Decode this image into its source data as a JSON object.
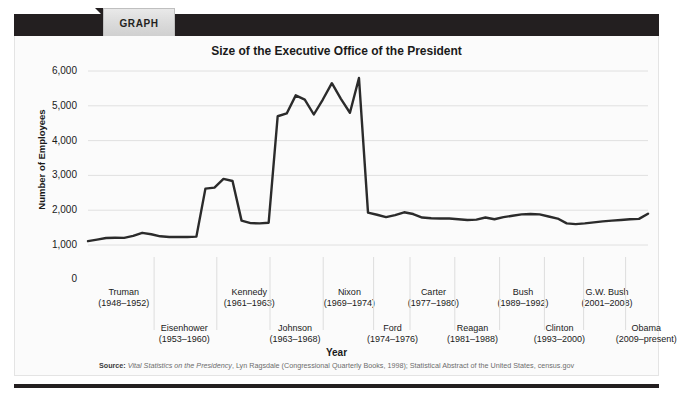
{
  "header": {
    "tab_label": "GRAPH"
  },
  "chart_data": {
    "type": "line",
    "title": "Size of the Executive Office of the President",
    "xlabel": "Year",
    "ylabel": "Number of Employees",
    "ylim": [
      1000,
      6000
    ],
    "axis_break": true,
    "zero_tick": "0",
    "grid": true,
    "legend": "none",
    "line_color": "#2b2b2b",
    "ytick_labels": [
      "6,000",
      "5,000",
      "4,000",
      "3,000",
      "2,000",
      "1,000"
    ],
    "ytick_values": [
      6000,
      5000,
      4000,
      3000,
      2000,
      1000
    ],
    "x": [
      1948,
      1949,
      1950,
      1951,
      1952,
      1953,
      1954,
      1955,
      1956,
      1957,
      1958,
      1959,
      1960,
      1961,
      1962,
      1963,
      1964,
      1965,
      1966,
      1967,
      1968,
      1969,
      1970,
      1971,
      1972,
      1973,
      1974,
      1975,
      1976,
      1977,
      1978,
      1979,
      1980,
      1981,
      1982,
      1983,
      1984,
      1985,
      1986,
      1987,
      1988,
      1989,
      1990,
      1991,
      1992,
      1993,
      1994,
      1995,
      1996,
      1997,
      1998,
      1999,
      2000,
      2001,
      2002,
      2003,
      2004,
      2005,
      2006,
      2007,
      2008,
      2009,
      2010
    ],
    "values": [
      1110,
      1155,
      1200,
      1210,
      1205,
      1260,
      1350,
      1310,
      1250,
      1230,
      1230,
      1230,
      1240,
      2620,
      2650,
      2900,
      2840,
      1700,
      1630,
      1620,
      1640,
      4700,
      4780,
      5300,
      5180,
      4750,
      5180,
      5650,
      5200,
      4800,
      5800,
      1930,
      1870,
      1800,
      1860,
      1940,
      1890,
      1790,
      1770,
      1760,
      1760,
      1740,
      1720,
      1730,
      1790,
      1740,
      1800,
      1840,
      1880,
      1890,
      1880,
      1820,
      1760,
      1620,
      1600,
      1620,
      1650,
      1680,
      1700,
      1720,
      1740,
      1750,
      1900
    ],
    "series_name": "Executive Office of the President employees",
    "terms": [
      {
        "name": "Truman",
        "years": "(1948–1952)",
        "row": 0,
        "center_pct": 6.2
      },
      {
        "name": "Eisenhower",
        "years": "(1953–1960)",
        "row": 1,
        "center_pct": 17.0
      },
      {
        "name": "Kennedy",
        "years": "(1961–1963)",
        "row": 0,
        "center_pct": 28.6
      },
      {
        "name": "Johnson",
        "years": "(1963–1968)",
        "row": 1,
        "center_pct": 36.8
      },
      {
        "name": "Nixon",
        "years": "(1969–1974)",
        "row": 0,
        "center_pct": 46.5
      },
      {
        "name": "Ford",
        "years": "(1974–1976)",
        "row": 1,
        "center_pct": 54.2
      },
      {
        "name": "Carter",
        "years": "(1977–1980)",
        "row": 0,
        "center_pct": 61.5
      },
      {
        "name": "Reagan",
        "years": "(1981–1988)",
        "row": 1,
        "center_pct": 68.5
      },
      {
        "name": "Bush",
        "years": "(1989–1992)",
        "row": 0,
        "center_pct": 77.5
      },
      {
        "name": "Clinton",
        "years": "(1993–2000)",
        "row": 1,
        "center_pct": 84.0
      },
      {
        "name": "G.W. Bush",
        "years": "(2001–2008)",
        "row": 0,
        "center_pct": 92.5
      },
      {
        "name": "Obama",
        "years": "(2009–present)",
        "row": 1,
        "center_pct": 99.5
      }
    ],
    "dividers_pct": [
      11.8,
      23.0,
      32.5,
      42.0,
      51.0,
      57.5,
      65.5,
      73.5,
      81.5,
      88.5,
      96.0
    ]
  },
  "source": {
    "label": "Source:",
    "italic_part": "Vital Statistics on the Presidency",
    "rest": ", Lyn Ragsdale (Congressional Quarterly Books, 1998); Statistical Abstract of the United States, census.gov"
  }
}
